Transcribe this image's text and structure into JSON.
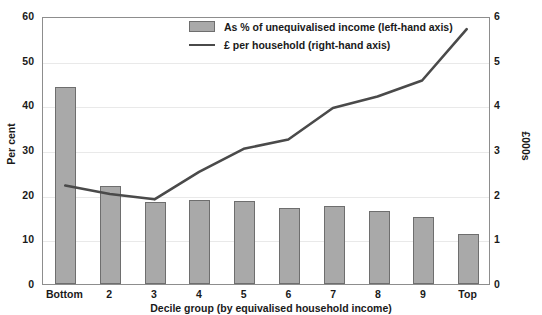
{
  "chart_data": {
    "type": "bar",
    "title": "",
    "xlabel": "Decile group (by equivalised household income)",
    "ylabel": "Per cent",
    "ylabel_right": "£000s",
    "categories": [
      "Bottom",
      "2",
      "3",
      "4",
      "5",
      "6",
      "7",
      "8",
      "9",
      "Top"
    ],
    "ylim": [
      0,
      60
    ],
    "ylim_right": [
      0,
      6
    ],
    "yticks": [
      "0",
      "10",
      "20",
      "30",
      "40",
      "50",
      "60"
    ],
    "yticks_right": [
      "0",
      "1",
      "2",
      "3",
      "4",
      "5",
      "6"
    ],
    "grid": true,
    "legend_position": "top-center",
    "series": [
      {
        "name": "As % of unequivalised income (left-hand axis)",
        "type": "bar",
        "axis": "left",
        "color": "#a9a9a9",
        "values": [
          44.0,
          22.0,
          18.4,
          18.7,
          18.6,
          17.0,
          17.4,
          16.3,
          15.0,
          11.1
        ]
      },
      {
        "name": "£ per household (right-hand axis)",
        "type": "line",
        "axis": "right",
        "color": "#4a4a4a",
        "values": [
          2.22,
          2.03,
          1.91,
          2.53,
          3.05,
          3.26,
          3.97,
          4.23,
          4.59,
          5.75
        ]
      }
    ]
  },
  "legend": {
    "items": [
      {
        "label": "As % of unequivalised income (left-hand axis)",
        "marker": "bar-swatch"
      },
      {
        "label": "£ per household (right-hand axis)",
        "marker": "line-sample"
      }
    ]
  },
  "top_strip": {
    "text": ""
  }
}
